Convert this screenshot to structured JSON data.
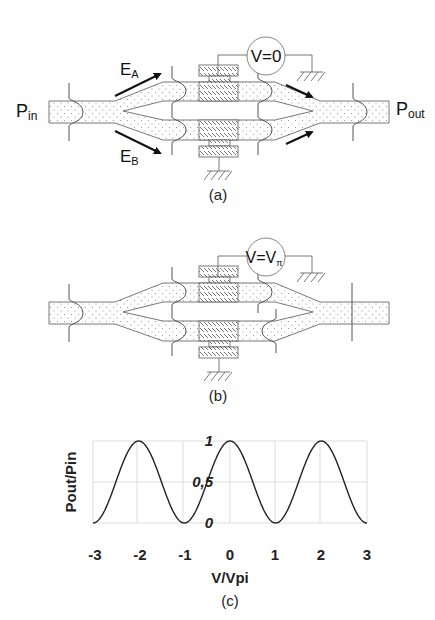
{
  "figure_a": {
    "caption": "(a)",
    "input_label": "P",
    "input_sub": "in",
    "output_label": "P",
    "output_sub": "out",
    "arm_a_label": "E",
    "arm_a_sub": "A",
    "arm_b_label": "E",
    "arm_b_sub": "B",
    "voltage_label": "V=0"
  },
  "figure_b": {
    "caption": "(b)",
    "voltage_label": "V=V",
    "voltage_sub": "π"
  },
  "figure_c": {
    "caption": "(c)"
  },
  "chart_data": {
    "type": "line",
    "title": "",
    "xlabel": "V/Vpi",
    "ylabel": "Pout/Pin",
    "xlim": [
      -3,
      3
    ],
    "ylim": [
      0,
      1
    ],
    "x_ticks": [
      "-3",
      "-2",
      "-1",
      "0",
      "1",
      "2",
      "3"
    ],
    "y_ticks": [
      "0",
      "0,5",
      "1"
    ],
    "grid": true,
    "legend": "none",
    "series": [
      {
        "name": "Pout/Pin = cos²(πV/2Vπ)",
        "x": [
          -3,
          -2.5,
          -2,
          -1.5,
          -1,
          -0.5,
          0,
          0.5,
          1,
          1.5,
          2,
          2.5,
          3
        ],
        "y": [
          0,
          0.5,
          1,
          0.5,
          0,
          0.5,
          1,
          0.5,
          0,
          0.5,
          1,
          0.5,
          0
        ]
      }
    ]
  }
}
